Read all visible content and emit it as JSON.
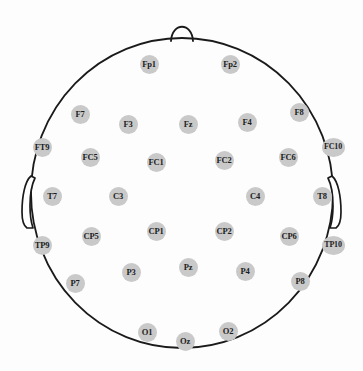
{
  "diagram": {
    "type": "eeg-electrode-montage",
    "view": "superior (top-down), nose at top",
    "background_color": "#fdfdfd",
    "outline_color": "#1a1a1a",
    "electrode_fill_color": "#c9c9c9",
    "electrode_label_color": "#1c1c1c",
    "electrode_count": 31
  },
  "head": {
    "center_x": 182,
    "center_y": 193,
    "radius_x": 151,
    "radius_y": 155,
    "nose_label": "nose-marker",
    "left_ear_label": "left-ear-marker",
    "right_ear_label": "right-ear-marker"
  },
  "electrodes": [
    {
      "label": "Fp1",
      "x": 149,
      "y": 64,
      "row": "prefrontal",
      "side": "left"
    },
    {
      "label": "Fp2",
      "x": 230,
      "y": 64,
      "row": "prefrontal",
      "side": "right"
    },
    {
      "label": "F7",
      "x": 80,
      "y": 114,
      "row": "frontal",
      "side": "left"
    },
    {
      "label": "F3",
      "x": 128,
      "y": 124,
      "row": "frontal",
      "side": "left"
    },
    {
      "label": "Fz",
      "x": 188,
      "y": 124,
      "row": "frontal",
      "side": "midline"
    },
    {
      "label": "F4",
      "x": 247,
      "y": 122,
      "row": "frontal",
      "side": "right"
    },
    {
      "label": "F8",
      "x": 299,
      "y": 112,
      "row": "frontal",
      "side": "right"
    },
    {
      "label": "FT9",
      "x": 42,
      "y": 147,
      "row": "frontotemporal",
      "side": "left"
    },
    {
      "label": "FC5",
      "x": 90,
      "y": 157,
      "row": "frontocentral",
      "side": "left"
    },
    {
      "label": "FC1",
      "x": 156,
      "y": 162,
      "row": "frontocentral",
      "side": "left"
    },
    {
      "label": "FC2",
      "x": 224,
      "y": 160,
      "row": "frontocentral",
      "side": "right"
    },
    {
      "label": "FC6",
      "x": 288,
      "y": 157,
      "row": "frontocentral",
      "side": "right"
    },
    {
      "label": "FC10",
      "x": 333,
      "y": 147,
      "row": "frontocentral",
      "side": "right"
    },
    {
      "label": "T7",
      "x": 52,
      "y": 196,
      "row": "temporal",
      "side": "left"
    },
    {
      "label": "C3",
      "x": 118,
      "y": 196,
      "row": "central",
      "side": "left"
    },
    {
      "label": "C4",
      "x": 255,
      "y": 196,
      "row": "central",
      "side": "right"
    },
    {
      "label": "T8",
      "x": 322,
      "y": 196,
      "row": "temporal",
      "side": "right"
    },
    {
      "label": "TP9",
      "x": 42,
      "y": 245,
      "row": "temporoparietal",
      "side": "left"
    },
    {
      "label": "CP5",
      "x": 91,
      "y": 236,
      "row": "centroparietal",
      "side": "left"
    },
    {
      "label": "CP1",
      "x": 156,
      "y": 231,
      "row": "centroparietal",
      "side": "left"
    },
    {
      "label": "CP2",
      "x": 224,
      "y": 231,
      "row": "centroparietal",
      "side": "right"
    },
    {
      "label": "CP6",
      "x": 289,
      "y": 236,
      "row": "centroparietal",
      "side": "right"
    },
    {
      "label": "TP10",
      "x": 333,
      "y": 245,
      "row": "temporoparietal",
      "side": "right"
    },
    {
      "label": "P7",
      "x": 75,
      "y": 283,
      "row": "parietal",
      "side": "left"
    },
    {
      "label": "P3",
      "x": 131,
      "y": 272,
      "row": "parietal",
      "side": "left"
    },
    {
      "label": "Pz",
      "x": 188,
      "y": 267,
      "row": "parietal",
      "side": "midline"
    },
    {
      "label": "P4",
      "x": 245,
      "y": 271,
      "row": "parietal",
      "side": "right"
    },
    {
      "label": "P8",
      "x": 300,
      "y": 281,
      "row": "parietal",
      "side": "right"
    },
    {
      "label": "O1",
      "x": 147,
      "y": 332,
      "row": "occipital",
      "side": "left"
    },
    {
      "label": "Oz",
      "x": 185,
      "y": 341,
      "row": "occipital",
      "side": "midline"
    },
    {
      "label": "O2",
      "x": 228,
      "y": 331,
      "row": "occipital",
      "side": "right"
    }
  ]
}
